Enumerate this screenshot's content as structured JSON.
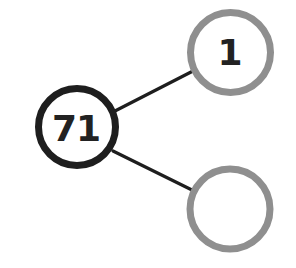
{
  "diagram": {
    "type": "number-bond",
    "whole": {
      "value": "71",
      "stroke_color": "#1e1e1e"
    },
    "parts": [
      {
        "value": "1",
        "stroke_color": "#8f8f8f"
      },
      {
        "value": "",
        "stroke_color": "#8f8f8f"
      }
    ],
    "connector_color": "#1e1e1e"
  }
}
